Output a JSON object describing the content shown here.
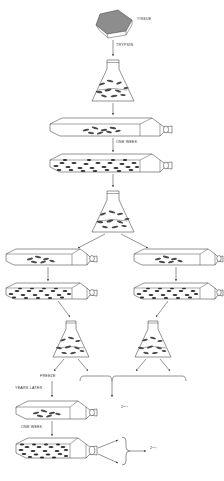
{
  "diagram": {
    "type": "flowchart",
    "background_color": "#ffffff",
    "line_color": "#3a3a3a",
    "labels": {
      "tissue": "TISSUE",
      "trypsin": "TRYPSIN",
      "one_week_1": "ONE WEEK",
      "freeze": "FREEZE",
      "years_later": "YEARS LATER",
      "one_week_2": "ONE WEEK",
      "yield_mid": "2ⁿ⁺¹",
      "yield_bottom": "2ⁿ⁺¹"
    },
    "nodes": [
      {
        "id": "tissue-block",
        "kind": "tissue",
        "label": "TISSUE"
      },
      {
        "id": "flask-erlen-1",
        "kind": "erlenmeyer",
        "label": ""
      },
      {
        "id": "culture-flask-1",
        "kind": "culture-flask",
        "density": "sparse"
      },
      {
        "id": "culture-flask-2",
        "kind": "culture-flask",
        "density": "confluent"
      },
      {
        "id": "flask-erlen-2",
        "kind": "erlenmeyer",
        "label": ""
      },
      {
        "id": "culture-flask-L1",
        "kind": "culture-flask",
        "density": "sparse"
      },
      {
        "id": "culture-flask-R1",
        "kind": "culture-flask",
        "density": "sparse"
      },
      {
        "id": "culture-flask-L2",
        "kind": "culture-flask",
        "density": "confluent"
      },
      {
        "id": "culture-flask-R2",
        "kind": "culture-flask",
        "density": "confluent"
      },
      {
        "id": "flask-erlen-L",
        "kind": "erlenmeyer",
        "label": ""
      },
      {
        "id": "flask-erlen-R",
        "kind": "erlenmeyer",
        "label": ""
      },
      {
        "id": "culture-flask-3",
        "kind": "culture-flask",
        "density": "sparse"
      },
      {
        "id": "culture-flask-4",
        "kind": "culture-flask",
        "density": "confluent"
      }
    ],
    "edges": [
      {
        "from": "tissue-block",
        "to": "flask-erlen-1",
        "label": "TRYPSIN"
      },
      {
        "from": "flask-erlen-1",
        "to": "culture-flask-1",
        "label": ""
      },
      {
        "from": "culture-flask-1",
        "to": "culture-flask-2",
        "label": "ONE WEEK"
      },
      {
        "from": "culture-flask-2",
        "to": "flask-erlen-2",
        "label": ""
      },
      {
        "from": "flask-erlen-2",
        "to": "culture-flask-L1",
        "label": ""
      },
      {
        "from": "flask-erlen-2",
        "to": "culture-flask-R1",
        "label": ""
      },
      {
        "from": "culture-flask-L1",
        "to": "culture-flask-L2",
        "label": ""
      },
      {
        "from": "culture-flask-R1",
        "to": "culture-flask-R2",
        "label": ""
      },
      {
        "from": "culture-flask-L2",
        "to": "flask-erlen-L",
        "label": ""
      },
      {
        "from": "culture-flask-R2",
        "to": "flask-erlen-R",
        "label": ""
      },
      {
        "from": "flask-erlen-L",
        "to": "culture-flask-3",
        "label": "FREEZE / YEARS LATER"
      },
      {
        "from": "culture-flask-3",
        "to": "culture-flask-4",
        "label": "ONE WEEK"
      },
      {
        "from": "culture-flask-4",
        "to": "yield-bottom",
        "label": "2ⁿ⁺¹"
      }
    ]
  }
}
